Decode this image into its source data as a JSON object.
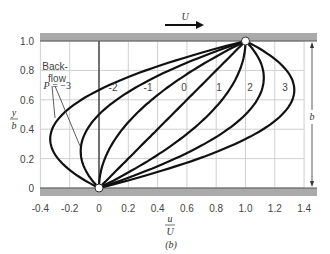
{
  "chart_data": {
    "type": "line",
    "title": "",
    "xlabel": "u/U",
    "ylabel": "y/b",
    "xlim": [
      -0.4,
      1.4
    ],
    "ylim": [
      0,
      1.0
    ],
    "xticks": [
      "-0.4",
      "-0.2",
      "0",
      "0.2",
      "0.4",
      "0.6",
      "0.8",
      "1.0",
      "1.2",
      "1.4"
    ],
    "yticks": [
      "0",
      "0.2",
      "0.4",
      "0.6",
      "0.8",
      "1.0"
    ],
    "grid": true,
    "formula": "u/U = y/b + P (y/b)(1 - y/b)",
    "series": [
      {
        "name": "P = -3",
        "P": -3
      },
      {
        "name": "-2",
        "P": -2
      },
      {
        "name": "-1",
        "P": -1
      },
      {
        "name": "0",
        "P": 0
      },
      {
        "name": "1",
        "P": 1
      },
      {
        "name": "2",
        "P": 2
      },
      {
        "name": "3",
        "P": 3
      }
    ],
    "annotations": [
      "Back-flow",
      "U",
      "b",
      "(b)"
    ]
  },
  "labels": {
    "u_num": "u",
    "u_den": "U",
    "y_num": "y",
    "y_den": "b",
    "velocity": "U",
    "gap": "b",
    "backflow_1": "Back-",
    "backflow_2": "flow",
    "caption": "(b)",
    "p_prefix": "P",
    "p_eq": "= −3"
  }
}
